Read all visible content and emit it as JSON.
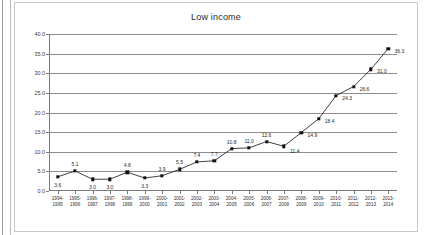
{
  "document": {
    "frame_accent": "#9a9a9a"
  },
  "chart_data": {
    "type": "line",
    "title": "Low income",
    "xlabel": "",
    "ylabel": "",
    "ylim": [
      0.0,
      40.0
    ],
    "ytick_step": 5.0,
    "grid": true,
    "legend": false,
    "legend_position": "none",
    "series_color": "#111111",
    "marker": "square",
    "categories": [
      "1994-\n1995",
      "1995-\n1996",
      "1996-\n1997",
      "1997-\n1998",
      "1998-\n1999",
      "1999-\n2000",
      "2000-\n2001",
      "2001-\n2002",
      "2002-\n2003",
      "2003-\n2004",
      "2004-\n2005",
      "2005-\n2006",
      "2006-\n2007",
      "2007-\n2008",
      "2008-\n2009",
      "2009-\n2010",
      "2010-\n2011",
      "2011-\n2012",
      "2012-\n2013",
      "2013-\n2014"
    ],
    "category_lines": [
      [
        "1994-",
        "1995"
      ],
      [
        "1995-",
        "1996"
      ],
      [
        "1996-",
        "1997"
      ],
      [
        "1997-",
        "1998"
      ],
      [
        "1998-",
        "1999"
      ],
      [
        "1999-",
        "2000"
      ],
      [
        "2000-",
        "2001"
      ],
      [
        "2001-",
        "2002"
      ],
      [
        "2002-",
        "2003"
      ],
      [
        "2003-",
        "2004"
      ],
      [
        "2004-",
        "2005"
      ],
      [
        "2005-",
        "2006"
      ],
      [
        "2006-",
        "2007"
      ],
      [
        "2007-",
        "2008"
      ],
      [
        "2008-",
        "2009"
      ],
      [
        "2009-",
        "2010"
      ],
      [
        "2010-",
        "2011"
      ],
      [
        "2011-",
        "2012"
      ],
      [
        "2012-",
        "2013"
      ],
      [
        "2013-",
        "2014"
      ]
    ],
    "values": [
      3.6,
      5.1,
      3.0,
      3.0,
      4.8,
      3.3,
      3.9,
      5.5,
      7.4,
      7.7,
      10.8,
      11.0,
      12.6,
      11.4,
      14.9,
      18.4,
      24.3,
      26.6,
      31.0,
      36.3
    ],
    "data_labels": [
      "3.6",
      "5.1",
      "3.0",
      "3.0",
      "4.8",
      "3.3",
      "3.9",
      "5.5",
      "7.4",
      "7.7",
      "10.8",
      "11.0",
      "12.6",
      "11.4",
      "14.9",
      "18.4",
      "24.3",
      "26.6",
      "31.0",
      "36.3"
    ],
    "data_label_positions": [
      "below",
      "above",
      "below",
      "below",
      "above",
      "below",
      "above",
      "above",
      "above",
      "above",
      "above",
      "above",
      "above",
      "below-right",
      "right",
      "right",
      "right",
      "right",
      "right",
      "right"
    ],
    "ytick_labels": [
      "0.0",
      "5.0",
      "10.0",
      "15.0",
      "20.0",
      "25.0",
      "30.0",
      "35.0",
      "40.0"
    ],
    "ytick_values": [
      0.0,
      5.0,
      10.0,
      15.0,
      20.0,
      25.0,
      30.0,
      35.0,
      40.0
    ]
  }
}
